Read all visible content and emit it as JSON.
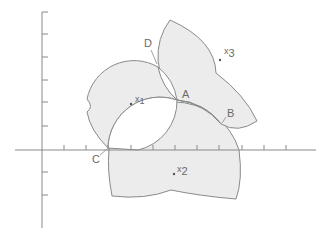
{
  "figure": {
    "type": "diagram",
    "colors": {
      "fill": "#ececec",
      "stroke": "#8a8a8a",
      "axis": "#8a8a8a",
      "text": "#6a6a6a"
    },
    "points": {
      "x1": {
        "label": "x",
        "sub": "1"
      },
      "x2": {
        "label": "x",
        "sub": "2"
      },
      "x3": {
        "label": "x",
        "sub": "3"
      }
    },
    "intersections": {
      "A": "A",
      "B": "B",
      "C": "C",
      "D": "D"
    },
    "axes": {
      "x_ticks": 11,
      "y_ticks_above": 6,
      "y_ticks_below": 2
    }
  }
}
